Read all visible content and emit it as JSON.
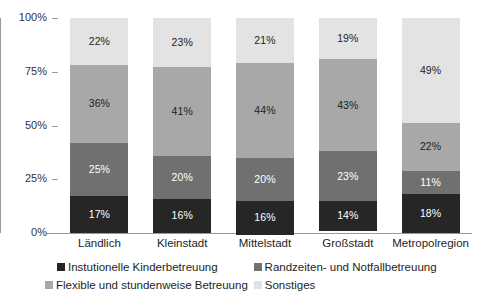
{
  "chart_data": {
    "type": "bar",
    "subtype": "stacked-100-percent",
    "title": "",
    "xlabel": "",
    "ylabel": "",
    "ylim": [
      0,
      100
    ],
    "ytick_labels": [
      "100%",
      "75%",
      "50%",
      "25%",
      "0%"
    ],
    "ytick_values": [
      100,
      75,
      50,
      25,
      0
    ],
    "grid": false,
    "legend_position": "bottom",
    "value_suffix": "%",
    "categories": [
      "Ländlich",
      "Kleinstadt",
      "Mittelstadt",
      "Großstadt",
      "Metropolregion"
    ],
    "series": [
      {
        "name": "Instutionelle Kinderbetreuung",
        "color": "#262626",
        "label_color": "on-dark",
        "values": [
          17,
          16,
          16,
          14,
          18
        ],
        "value_labels": [
          "17%",
          "16%",
          "16%",
          "14%",
          "18%"
        ]
      },
      {
        "name": "Randzeiten- und Notfallbetreuung",
        "color": "#707070",
        "label_color": "on-dark",
        "values": [
          25,
          20,
          20,
          23,
          11
        ],
        "value_labels": [
          "25%",
          "20%",
          "20%",
          "23%",
          "11%"
        ]
      },
      {
        "name": "Flexible und stundenweise Betreuung",
        "color": "#a8a8a8",
        "label_color": "on-light",
        "values": [
          36,
          41,
          44,
          43,
          22
        ],
        "value_labels": [
          "36%",
          "41%",
          "44%",
          "43%",
          "22%"
        ]
      },
      {
        "name": "Sonstiges",
        "color": "#e3e3e3",
        "label_color": "on-light",
        "values": [
          22,
          23,
          21,
          19,
          49
        ],
        "value_labels": [
          "22%",
          "23%",
          "21%",
          "19%",
          "49%"
        ]
      }
    ]
  },
  "axis": {
    "y_ticks": [
      {
        "label": "100%",
        "value": 100
      },
      {
        "label": "75%",
        "value": 75
      },
      {
        "label": "50%",
        "value": 50
      },
      {
        "label": "25%",
        "value": 25
      },
      {
        "label": "0%",
        "value": 0
      }
    ]
  },
  "legend": {
    "row1": [
      {
        "name": "Instutionelle Kinderbetreuung",
        "color": "#262626"
      },
      {
        "name": "Randzeiten- und Notfallbetreuung",
        "color": "#707070"
      }
    ],
    "row2": [
      {
        "name": "Flexible und stundenweise Betreuung",
        "color": "#a8a8a8"
      },
      {
        "name": "Sonstiges",
        "color": "#e3e3e3"
      }
    ]
  }
}
